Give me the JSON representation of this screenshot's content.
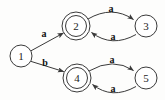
{
  "diagram": {
    "type": "finite-state-automaton",
    "title": "",
    "width": 165,
    "height": 100,
    "background_color": "#fdfdfc",
    "stroke_color": "#3a3a3a",
    "text_color": "#1d1d1d",
    "states": [
      {
        "id": "1",
        "label": "1",
        "cx": 21,
        "cy": 56,
        "r": 11,
        "accepting": false,
        "start": true
      },
      {
        "id": "2",
        "label": "2",
        "cx": 76,
        "cy": 26,
        "r": 11,
        "r_outer": 14,
        "accepting": true,
        "start": false
      },
      {
        "id": "3",
        "label": "3",
        "cx": 146,
        "cy": 26,
        "r": 11,
        "accepting": false,
        "start": false
      },
      {
        "id": "4",
        "label": "4",
        "cx": 77,
        "cy": 78,
        "r": 11,
        "r_outer": 14,
        "accepting": true,
        "start": false
      },
      {
        "id": "5",
        "label": "5",
        "cx": 146,
        "cy": 78,
        "r": 11,
        "accepting": false,
        "start": false
      }
    ],
    "transitions": [
      {
        "from": "1",
        "to": "2",
        "label": "a",
        "label_x": 44,
        "label_y": 33,
        "shape": "straight"
      },
      {
        "from": "1",
        "to": "4",
        "label": "b",
        "label_x": 45,
        "label_y": 62,
        "shape": "straight"
      },
      {
        "from": "2",
        "to": "3",
        "label": "a",
        "label_x": 111,
        "label_y": 8,
        "shape": "curve-above"
      },
      {
        "from": "3",
        "to": "2",
        "label": "a",
        "label_x": 113,
        "label_y": 36,
        "shape": "curve-below"
      },
      {
        "from": "4",
        "to": "5",
        "label": "a",
        "label_x": 112,
        "label_y": 59,
        "shape": "curve-above"
      },
      {
        "from": "5",
        "to": "4",
        "label": "a",
        "label_x": 113,
        "label_y": 88,
        "shape": "curve-below"
      }
    ],
    "alphabet": [
      "a",
      "b"
    ],
    "accepting_states": [
      "2",
      "4"
    ],
    "start_state": "1"
  }
}
